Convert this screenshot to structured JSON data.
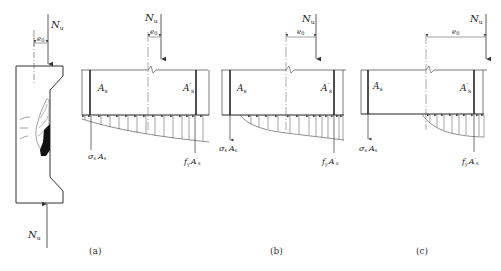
{
  "figure": {
    "panels": [
      {
        "id": "a",
        "caption": "(a)",
        "column": {
          "top_force": "N",
          "top_force_sub": "u",
          "bottom_force": "N",
          "bottom_force_sub": "u",
          "eccentricity": "e",
          "eccentricity_sub": "0"
        },
        "section": {
          "force": "N",
          "force_sub": "u",
          "eccentricity": "e",
          "eccentricity_sub": "0",
          "left_steel": "A",
          "left_steel_sub": "s",
          "right_steel": "A",
          "right_steel_prime": "′",
          "right_steel_sub": "s",
          "left_steel_force": "σ",
          "left_steel_force_sub": "s",
          "left_steel_force_area": "A",
          "left_steel_force_area_sub": "s",
          "right_steel_force": "f",
          "right_steel_force_prime": "′",
          "right_steel_force_sub": "y",
          "right_steel_force_area": "A",
          "right_steel_force_area_prime": "′",
          "right_steel_force_area_sub": "s"
        }
      },
      {
        "id": "b",
        "caption": "(b)",
        "section": {
          "force": "N",
          "force_sub": "u",
          "eccentricity": "e",
          "eccentricity_sub": "0",
          "left_steel": "A",
          "left_steel_sub": "s",
          "right_steel": "A",
          "right_steel_prime": "′",
          "right_steel_sub": "s",
          "left_steel_force": "σ",
          "left_steel_force_sub": "s",
          "left_steel_force_area": "A",
          "left_steel_force_area_sub": "s",
          "right_steel_force": "f",
          "right_steel_force_prime": "′",
          "right_steel_force_sub": "y",
          "right_steel_force_area": "A",
          "right_steel_force_area_prime": "′",
          "right_steel_force_area_sub": "s"
        }
      },
      {
        "id": "c",
        "caption": "(c)",
        "section": {
          "force": "N",
          "force_sub": "u",
          "eccentricity": "e",
          "eccentricity_sub": "0",
          "left_steel": "A",
          "left_steel_sub": "s",
          "right_steel": "A",
          "right_steel_prime": "′",
          "right_steel_sub": "s",
          "left_steel_force": "σ",
          "left_steel_force_sub": "s",
          "left_steel_force_area": "A",
          "left_steel_force_area_sub": "s",
          "right_steel_force": "f",
          "right_steel_force_prime": "′",
          "right_steel_force_sub": "y",
          "right_steel_force_area": "A",
          "right_steel_force_area_prime": "′",
          "right_steel_force_area_sub": "s"
        }
      }
    ],
    "colors": {
      "line": "#333333",
      "thin": "#555555",
      "steel": "#222222"
    }
  }
}
